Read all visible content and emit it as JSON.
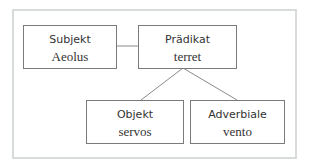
{
  "diagram": {
    "type": "sentence-structure-tree",
    "nodes": [
      {
        "id": "subjekt",
        "role": "Subjekt",
        "word": "Aeolus"
      },
      {
        "id": "praedikat",
        "role": "Prädikat",
        "word": "terret"
      },
      {
        "id": "objekt",
        "role": "Objekt",
        "word": "servos"
      },
      {
        "id": "adverbiale",
        "role": "Adverbiale",
        "word": "vento"
      }
    ],
    "edges": [
      {
        "from": "subjekt",
        "to": "praedikat"
      },
      {
        "from": "praedikat",
        "to": "objekt"
      },
      {
        "from": "praedikat",
        "to": "adverbiale"
      }
    ],
    "colors": {
      "frame_border": "#d8dcd8",
      "box_border": "#7a7a7a",
      "line": "#8a8a8a",
      "text": "#333333"
    }
  }
}
